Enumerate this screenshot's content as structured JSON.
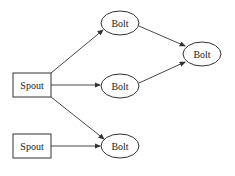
{
  "diagram": {
    "type": "storm-topology",
    "nodes": [
      {
        "id": "spout1",
        "label": "Spout",
        "shape": "rect",
        "x": 13,
        "y": 73,
        "w": 38,
        "h": 24
      },
      {
        "id": "spout2",
        "label": "Spout",
        "shape": "rect",
        "x": 13,
        "y": 134,
        "w": 38,
        "h": 24
      },
      {
        "id": "bolt_top",
        "label": "Bolt",
        "shape": "ellipse",
        "cx": 120,
        "cy": 23,
        "rx": 19,
        "ry": 12
      },
      {
        "id": "bolt_mid",
        "label": "Bolt",
        "shape": "ellipse",
        "cx": 120,
        "cy": 86,
        "rx": 19,
        "ry": 12
      },
      {
        "id": "bolt_bot",
        "label": "Bolt",
        "shape": "ellipse",
        "cx": 120,
        "cy": 146,
        "rx": 19,
        "ry": 12
      },
      {
        "id": "bolt_right",
        "label": "Bolt",
        "shape": "ellipse",
        "cx": 202,
        "cy": 54,
        "rx": 19,
        "ry": 12
      }
    ],
    "edges": [
      {
        "from": "spout1",
        "to": "bolt_top"
      },
      {
        "from": "spout1",
        "to": "bolt_mid"
      },
      {
        "from": "spout1",
        "to": "bolt_bot"
      },
      {
        "from": "spout2",
        "to": "bolt_bot"
      },
      {
        "from": "bolt_top",
        "to": "bolt_right"
      },
      {
        "from": "bolt_mid",
        "to": "bolt_right"
      }
    ],
    "colors": {
      "stroke": "#333333",
      "fill": "#ffffff"
    }
  }
}
